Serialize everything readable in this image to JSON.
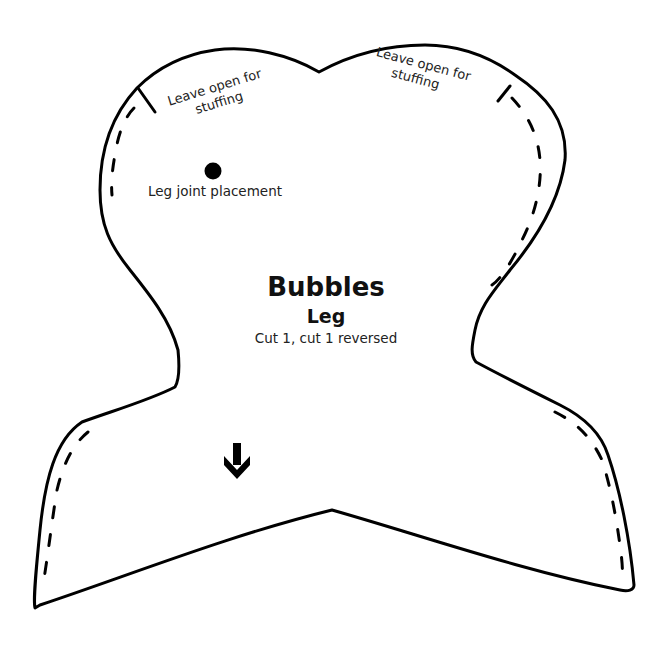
{
  "pattern": {
    "title": "Bubbles",
    "piece_name": "Leg",
    "cut_instructions": "Cut 1, cut 1 reversed",
    "joint_label": "Leg joint placement",
    "opening_left": {
      "line1": "Leave open for",
      "line2": "stuffing"
    },
    "opening_right": {
      "line1": "Leave open for",
      "line2": "stuffing"
    },
    "grainline_icon": "arrow-down-icon",
    "joint_marker_icon": "filled-circle-icon",
    "colors": {
      "line": "#000000",
      "background": "#ffffff"
    }
  }
}
